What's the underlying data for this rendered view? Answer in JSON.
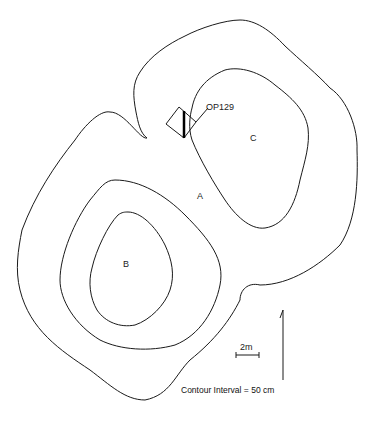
{
  "map": {
    "labels": {
      "op": "OP129",
      "a": "A",
      "b": "B",
      "c": "C"
    },
    "scale_bar": {
      "label": "2m"
    },
    "contour_interval": "Contour Interval = 50 cm",
    "north_arrow": "north-arrow"
  }
}
